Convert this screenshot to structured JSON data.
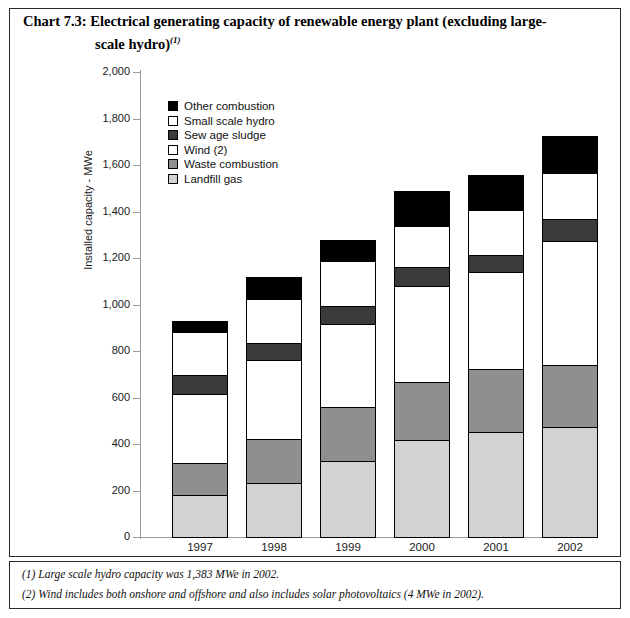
{
  "title": {
    "line1": "Chart 7.3: Electrical generating capacity of renewable energy plant (excluding large-",
    "line2": "scale hydro)",
    "superscript": "(1)"
  },
  "notes": {
    "note1": "(1) Large scale hydro capacity was 1,383 MWe in 2002.",
    "note2": "(2) Wind includes both onshore and offshore and also includes solar photovoltaics (4 MWe in 2002)."
  },
  "legend": {
    "position": "inside-top-left",
    "items": [
      {
        "label": "Other combustion",
        "color": "#000000"
      },
      {
        "label": "Small scale hydro",
        "color": "#ffffff"
      },
      {
        "label": "Sew age sludge",
        "color": "#3b3b3b"
      },
      {
        "label": "Wind (2)",
        "color": "#ffffff"
      },
      {
        "label": "Waste combustion",
        "color": "#8f8f8f"
      },
      {
        "label": "Landfill gas",
        "color": "#d2d2d2"
      }
    ]
  },
  "chart_data": {
    "type": "bar",
    "stacked": true,
    "xlabel": "",
    "ylabel": "Installed capacity - MWe",
    "categories": [
      "1997",
      "1998",
      "1999",
      "2000",
      "2001",
      "2002"
    ],
    "ylim": [
      0,
      2000
    ],
    "yticks": [
      "0",
      "200",
      "400",
      "600",
      "800",
      "1,000",
      "1,200",
      "1,400",
      "1,600",
      "1,800",
      "2,000"
    ],
    "ytick_values": [
      0,
      200,
      400,
      600,
      800,
      1000,
      1200,
      1400,
      1600,
      1800,
      2000
    ],
    "grid": false,
    "series": [
      {
        "name": "Landfill gas",
        "color": "#d2d2d2",
        "values": [
          185,
          236,
          330,
          420,
          455,
          477
        ]
      },
      {
        "name": "Waste combustion",
        "color": "#8f8f8f",
        "values": [
          140,
          194,
          237,
          255,
          275,
          271
        ]
      },
      {
        "name": "Wind (2)",
        "color": "#ffffff",
        "values": [
          305,
          344,
          363,
          417,
          423,
          540
        ]
      },
      {
        "name": "Sew age sludge",
        "color": "#3b3b3b",
        "values": [
          83,
          77,
          80,
          86,
          77,
          99
        ]
      },
      {
        "name": "Small scale hydro",
        "color": "#ffffff",
        "values": [
          190,
          194,
          199,
          180,
          196,
          202
        ]
      },
      {
        "name": "Other combustion",
        "color": "#000000",
        "values": [
          53,
          99,
          94,
          155,
          158,
          163
        ]
      }
    ],
    "totals": [
      956,
      1144,
      1303,
      1513,
      1584,
      1752
    ]
  }
}
